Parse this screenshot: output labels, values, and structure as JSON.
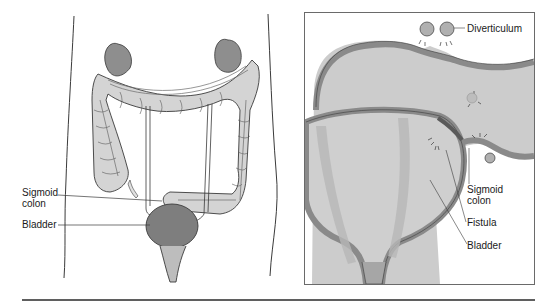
{
  "figure": {
    "left_panel": {
      "name": "abdomen-overview",
      "labels": {
        "sigmoid_colon": "Sigmoid\ncolon",
        "bladder": "Bladder"
      }
    },
    "right_panel": {
      "name": "close-up-fistula",
      "labels": {
        "diverticulum": "Diverticulum",
        "sigmoid_colon": "Sigmoid\ncolon",
        "fistula": "Fistula",
        "bladder": "Bladder"
      }
    },
    "colors": {
      "outline": "#3a3a3a",
      "tissue_light": "#d0d0d0",
      "tissue_mid": "#a8a8a8",
      "tissue_dark": "#8a8a8a",
      "background": "#ffffff",
      "panel_fill": "#cfcfcf"
    }
  }
}
